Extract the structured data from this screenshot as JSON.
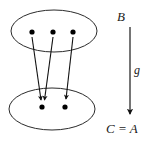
{
  "figure": {
    "type": "set-mapping-diagram",
    "stroke_color": "#2b2b2b",
    "dot_color": "#000000",
    "background_color": "#ffffff"
  },
  "domain_set": {
    "name": "upper-oval",
    "center_x": 54,
    "center_y": 31,
    "radius_x": 43,
    "radius_y": 21,
    "elements": [
      {
        "id": "b1",
        "x": 32,
        "y": 32
      },
      {
        "id": "b2",
        "x": 53,
        "y": 32
      },
      {
        "id": "b3",
        "x": 73,
        "y": 32
      }
    ]
  },
  "codomain_set": {
    "name": "lower-oval",
    "center_x": 52,
    "center_y": 109,
    "radius_x": 43,
    "radius_y": 21,
    "elements": [
      {
        "id": "c1",
        "x": 42,
        "y": 107
      },
      {
        "id": "c2",
        "x": 65,
        "y": 107
      }
    ]
  },
  "mapping_arrows": [
    {
      "id": "arrow-b1-c1",
      "from": "b1",
      "to": "c1",
      "x1": 32,
      "y1": 37,
      "x2": 41,
      "y2": 100
    },
    {
      "id": "arrow-b2-c1",
      "from": "b2",
      "to": "c1",
      "x1": 53,
      "y1": 37,
      "x2": 44,
      "y2": 100
    },
    {
      "id": "arrow-b3-c2",
      "from": "b3",
      "to": "c2",
      "x1": 73,
      "y1": 37,
      "x2": 66,
      "y2": 99
    }
  ],
  "function_arrow": {
    "name": "function-g-arrow",
    "x": 130,
    "y_start": 27,
    "y_end": 116,
    "label": "g"
  },
  "labels": {
    "source": "B",
    "function": "g",
    "target": "C = A"
  }
}
